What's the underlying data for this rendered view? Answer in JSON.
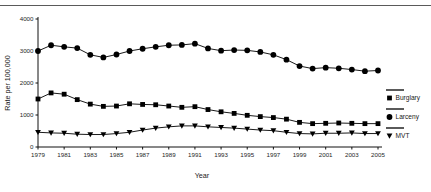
{
  "figure": {
    "name": "crime-rate-trend-chart",
    "background": "#ffffff",
    "foreground": "#000000"
  },
  "chart_data": {
    "type": "line",
    "title": "",
    "xlabel": "Year",
    "ylabel": "Rate per 100,000",
    "xlim": [
      1979,
      2005
    ],
    "ylim": [
      0,
      4000
    ],
    "grid": false,
    "legend_position": "right",
    "x": [
      1979,
      1980,
      1981,
      1982,
      1983,
      1984,
      1985,
      1986,
      1987,
      1988,
      1989,
      1990,
      1991,
      1992,
      1993,
      1994,
      1995,
      1996,
      1997,
      1998,
      1999,
      2000,
      2001,
      2002,
      2003,
      2004,
      2005
    ],
    "xticks": [
      1979,
      1981,
      1983,
      1985,
      1987,
      1989,
      1991,
      1993,
      1995,
      1997,
      1999,
      2001,
      2003,
      2005
    ],
    "xtick_labels": [
      "1979",
      "1981",
      "1983",
      "1985",
      "1987",
      "1989",
      "1991",
      "1993",
      "1995",
      "1997",
      "1999",
      "2001",
      "2003",
      "2005"
    ],
    "yticks": [
      0,
      1000,
      2000,
      3000,
      4000
    ],
    "ytick_labels": [
      "0",
      "1000",
      "2000",
      "3000",
      "4000"
    ],
    "series": [
      {
        "name": "Larceny",
        "marker": "circle",
        "values": [
          3000,
          3180,
          3130,
          3090,
          2880,
          2800,
          2890,
          3000,
          3070,
          3130,
          3180,
          3190,
          3230,
          3080,
          3010,
          3030,
          3020,
          2970,
          2880,
          2730,
          2530,
          2450,
          2480,
          2460,
          2420,
          2370,
          2390
        ]
      },
      {
        "name": "Burglary",
        "marker": "square",
        "values": [
          1500,
          1690,
          1650,
          1480,
          1340,
          1270,
          1280,
          1350,
          1330,
          1320,
          1280,
          1240,
          1260,
          1170,
          1100,
          1050,
          990,
          950,
          920,
          870,
          770,
          730,
          740,
          750,
          740,
          730,
          730
        ]
      },
      {
        "name": "MVT",
        "marker": "triangle",
        "values": [
          460,
          440,
          430,
          400,
          390,
          390,
          420,
          460,
          530,
          590,
          630,
          660,
          660,
          630,
          610,
          590,
          560,
          530,
          510,
          460,
          420,
          410,
          430,
          430,
          440,
          420,
          420
        ]
      }
    ]
  },
  "legend": {
    "entries": [
      {
        "label": "Burglary",
        "marker": "square"
      },
      {
        "label": "Larceny",
        "marker": "circle"
      },
      {
        "label": "MVT",
        "marker": "triangle"
      }
    ]
  }
}
